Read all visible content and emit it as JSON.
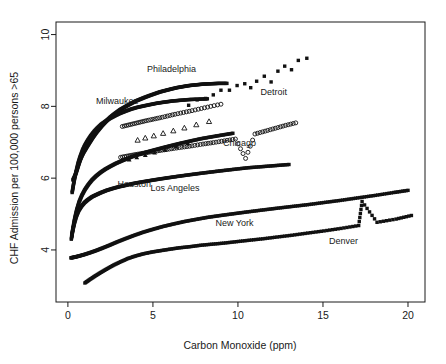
{
  "chart_data": {
    "type": "scatter",
    "title": "",
    "xlabel": "Carbon Monoxide (ppm)",
    "ylabel": "CHF Admission per 100,000 persons >65",
    "xlim": [
      -0.7,
      21.0
    ],
    "ylim": [
      2.55,
      10.35
    ],
    "xticks": [
      0,
      5,
      10,
      15,
      20
    ],
    "xtick_labels": [
      "0",
      "5",
      "10",
      "15",
      "20"
    ],
    "yticks": [
      4,
      6,
      8,
      10
    ],
    "ytick_labels": [
      "4",
      "6",
      "8",
      "10"
    ],
    "grid": false,
    "legend": "inline-annotations",
    "series": [
      {
        "name": "Philadelphia",
        "marker": "filled-square",
        "label_x": 6.1,
        "label_y": 8.95,
        "points": [
          [
            0.3,
            5.95
          ],
          [
            0.4,
            6.05
          ],
          [
            0.5,
            6.18
          ],
          [
            0.58,
            6.3
          ],
          [
            0.66,
            6.42
          ],
          [
            0.74,
            6.53
          ],
          [
            0.82,
            6.62
          ],
          [
            0.9,
            6.7
          ],
          [
            1.0,
            6.78
          ],
          [
            1.1,
            6.86
          ],
          [
            1.22,
            6.95
          ],
          [
            1.34,
            7.04
          ],
          [
            1.46,
            7.13
          ],
          [
            1.58,
            7.21
          ],
          [
            1.72,
            7.3
          ],
          [
            1.86,
            7.38
          ],
          [
            2.0,
            7.46
          ],
          [
            2.16,
            7.54
          ],
          [
            2.32,
            7.62
          ],
          [
            2.5,
            7.7
          ],
          [
            2.68,
            7.77
          ],
          [
            2.88,
            7.84
          ],
          [
            3.08,
            7.91
          ],
          [
            3.3,
            7.97
          ],
          [
            3.52,
            8.03
          ],
          [
            3.76,
            8.09
          ],
          [
            4.0,
            8.15
          ],
          [
            4.26,
            8.2
          ],
          [
            4.52,
            8.25
          ],
          [
            4.8,
            8.3
          ],
          [
            5.1,
            8.35
          ],
          [
            5.4,
            8.4
          ],
          [
            5.72,
            8.44
          ],
          [
            6.05,
            8.48
          ],
          [
            6.4,
            8.52
          ],
          [
            6.76,
            8.55
          ],
          [
            7.14,
            8.58
          ],
          [
            7.54,
            8.6
          ],
          [
            7.96,
            8.62
          ],
          [
            8.4,
            8.63
          ],
          [
            8.86,
            8.64
          ],
          [
            9.35,
            8.64
          ]
        ]
      },
      {
        "name": "Milwaukee",
        "marker": "filled-square",
        "label_x": 2.9,
        "label_y": 8.07,
        "points": [
          [
            0.25,
            5.6
          ],
          [
            0.32,
            5.8
          ],
          [
            0.4,
            6.0
          ],
          [
            0.5,
            6.22
          ],
          [
            0.6,
            6.42
          ],
          [
            0.72,
            6.6
          ],
          [
            0.86,
            6.78
          ],
          [
            1.0,
            6.92
          ],
          [
            1.16,
            7.05
          ],
          [
            1.34,
            7.18
          ],
          [
            1.54,
            7.3
          ],
          [
            1.74,
            7.4
          ],
          [
            1.96,
            7.5
          ],
          [
            2.2,
            7.58
          ],
          [
            2.46,
            7.66
          ],
          [
            2.74,
            7.73
          ],
          [
            3.04,
            7.8
          ],
          [
            3.36,
            7.86
          ],
          [
            3.7,
            7.92
          ],
          [
            4.06,
            7.97
          ],
          [
            4.44,
            8.01
          ],
          [
            4.84,
            8.05
          ],
          [
            5.26,
            8.09
          ],
          [
            5.7,
            8.12
          ],
          [
            6.16,
            8.15
          ],
          [
            6.64,
            8.17
          ],
          [
            7.14,
            8.19
          ],
          [
            7.66,
            8.2
          ],
          [
            8.2,
            8.21
          ]
        ]
      },
      {
        "name": "Detroit",
        "marker": "filled-square",
        "label_x": 12.1,
        "label_y": 8.33,
        "points": [
          [
            7.1,
            8.03
          ],
          [
            7.6,
            8.18
          ],
          [
            8.1,
            8.22
          ],
          [
            8.55,
            8.32
          ],
          [
            9.0,
            8.45
          ],
          [
            9.5,
            8.45
          ],
          [
            9.95,
            8.58
          ],
          [
            10.4,
            8.63
          ],
          [
            10.75,
            8.52
          ],
          [
            11.1,
            8.7
          ],
          [
            11.55,
            8.84
          ],
          [
            11.95,
            8.68
          ],
          [
            12.35,
            8.98
          ],
          [
            12.75,
            9.12
          ],
          [
            13.15,
            9.02
          ],
          [
            13.55,
            9.28
          ],
          [
            14.05,
            9.34
          ]
        ]
      },
      {
        "name": "Chicago",
        "marker": "open-circle",
        "label_x": 10.1,
        "label_y": 6.9,
        "points": [
          [
            3.1,
            6.58
          ],
          [
            3.55,
            6.62
          ],
          [
            4.0,
            6.66
          ],
          [
            4.5,
            6.7
          ],
          [
            5.0,
            6.74
          ],
          [
            5.55,
            6.78
          ],
          [
            6.1,
            6.82
          ],
          [
            6.7,
            6.86
          ],
          [
            7.3,
            6.9
          ],
          [
            7.95,
            6.95
          ],
          [
            8.55,
            6.99
          ],
          [
            9.2,
            7.04
          ],
          [
            9.85,
            7.09
          ],
          [
            10.45,
            6.55
          ],
          [
            11.0,
            7.23
          ],
          [
            11.6,
            7.31
          ],
          [
            12.2,
            7.39
          ],
          [
            12.8,
            7.47
          ],
          [
            13.4,
            7.54
          ]
        ]
      },
      {
        "name": "Houston",
        "marker": "filled-square",
        "label_x": 3.9,
        "label_y": 5.75,
        "points": [
          [
            0.22,
            4.38
          ],
          [
            0.3,
            4.62
          ],
          [
            0.4,
            4.88
          ],
          [
            0.52,
            5.12
          ],
          [
            0.66,
            5.34
          ],
          [
            0.82,
            5.52
          ],
          [
            1.0,
            5.68
          ],
          [
            1.2,
            5.82
          ],
          [
            1.42,
            5.95
          ],
          [
            1.66,
            6.06
          ],
          [
            1.92,
            6.16
          ],
          [
            2.2,
            6.25
          ],
          [
            2.5,
            6.33
          ],
          [
            2.82,
            6.41
          ],
          [
            3.16,
            6.48
          ],
          [
            3.52,
            6.55
          ],
          [
            3.9,
            6.62
          ],
          [
            4.3,
            6.68
          ],
          [
            4.74,
            6.74
          ],
          [
            5.2,
            6.8
          ],
          [
            5.68,
            6.86
          ],
          [
            6.18,
            6.92
          ],
          [
            6.7,
            6.98
          ],
          [
            7.26,
            7.04
          ],
          [
            7.84,
            7.1
          ],
          [
            8.44,
            7.15
          ],
          [
            9.06,
            7.2
          ],
          [
            9.7,
            7.25
          ]
        ]
      },
      {
        "name": "Los Angeles",
        "marker": "filled-square",
        "label_x": 6.3,
        "label_y": 5.64,
        "points": [
          [
            0.2,
            4.3
          ],
          [
            0.28,
            4.52
          ],
          [
            0.38,
            4.74
          ],
          [
            0.5,
            4.94
          ],
          [
            0.64,
            5.1
          ],
          [
            0.8,
            5.22
          ],
          [
            0.98,
            5.32
          ],
          [
            1.18,
            5.4
          ],
          [
            1.42,
            5.48
          ],
          [
            1.68,
            5.54
          ],
          [
            1.96,
            5.6
          ],
          [
            2.28,
            5.66
          ],
          [
            2.62,
            5.71
          ],
          [
            3.0,
            5.76
          ],
          [
            3.4,
            5.8
          ],
          [
            3.84,
            5.85
          ],
          [
            4.3,
            5.89
          ],
          [
            4.8,
            5.93
          ],
          [
            5.32,
            5.97
          ],
          [
            5.88,
            6.01
          ],
          [
            6.46,
            6.05
          ],
          [
            7.08,
            6.09
          ],
          [
            7.72,
            6.13
          ],
          [
            8.4,
            6.17
          ],
          [
            9.1,
            6.21
          ],
          [
            9.84,
            6.25
          ],
          [
            10.6,
            6.29
          ],
          [
            11.4,
            6.32
          ],
          [
            12.2,
            6.35
          ],
          [
            13.0,
            6.38
          ]
        ]
      },
      {
        "name": "New York",
        "marker": "filled-square",
        "label_x": 9.8,
        "label_y": 4.67,
        "points": [
          [
            0.18,
            3.78
          ],
          [
            0.4,
            3.8
          ],
          [
            0.65,
            3.83
          ],
          [
            0.95,
            3.87
          ],
          [
            1.28,
            3.92
          ],
          [
            1.64,
            3.98
          ],
          [
            2.02,
            4.05
          ],
          [
            2.44,
            4.13
          ],
          [
            2.88,
            4.22
          ],
          [
            3.36,
            4.31
          ],
          [
            3.86,
            4.4
          ],
          [
            4.4,
            4.49
          ],
          [
            4.96,
            4.57
          ],
          [
            5.56,
            4.65
          ],
          [
            6.18,
            4.72
          ],
          [
            6.84,
            4.79
          ],
          [
            7.52,
            4.85
          ],
          [
            8.24,
            4.91
          ],
          [
            8.98,
            4.96
          ],
          [
            9.76,
            5.01
          ],
          [
            10.56,
            5.06
          ],
          [
            11.4,
            5.11
          ],
          [
            12.26,
            5.16
          ],
          [
            13.16,
            5.21
          ],
          [
            14.08,
            5.26
          ],
          [
            15.04,
            5.32
          ],
          [
            16.02,
            5.38
          ],
          [
            17.04,
            5.45
          ],
          [
            18.08,
            5.52
          ],
          [
            19.16,
            5.6
          ],
          [
            20.0,
            5.66
          ]
        ]
      },
      {
        "name": "Denver",
        "marker": "filled-square",
        "label_x": 16.2,
        "label_y": 4.18,
        "points": [
          [
            1.0,
            3.08
          ],
          [
            1.3,
            3.18
          ],
          [
            1.62,
            3.28
          ],
          [
            1.96,
            3.38
          ],
          [
            2.32,
            3.48
          ],
          [
            2.7,
            3.58
          ],
          [
            3.1,
            3.67
          ],
          [
            3.52,
            3.76
          ],
          [
            3.96,
            3.83
          ],
          [
            4.42,
            3.89
          ],
          [
            4.92,
            3.94
          ],
          [
            5.44,
            3.98
          ],
          [
            5.98,
            4.02
          ],
          [
            6.56,
            4.06
          ],
          [
            7.16,
            4.09
          ],
          [
            7.8,
            4.13
          ],
          [
            8.46,
            4.16
          ],
          [
            9.16,
            4.19
          ],
          [
            9.9,
            4.23
          ],
          [
            10.66,
            4.27
          ],
          [
            11.46,
            4.31
          ],
          [
            12.3,
            4.36
          ],
          [
            13.18,
            4.41
          ],
          [
            14.1,
            4.47
          ],
          [
            15.06,
            4.53
          ],
          [
            16.06,
            4.6
          ],
          [
            17.1,
            4.68
          ],
          [
            17.3,
            5.35
          ],
          [
            18.18,
            4.77
          ],
          [
            19.3,
            4.86
          ],
          [
            20.2,
            4.96
          ]
        ]
      },
      {
        "name": "series-open-circles-upper",
        "marker": "open-circle",
        "label_x": null,
        "label_y": null,
        "points": [
          [
            3.2,
            7.44
          ],
          [
            3.55,
            7.48
          ],
          [
            3.9,
            7.52
          ],
          [
            4.25,
            7.56
          ],
          [
            4.6,
            7.6
          ],
          [
            5.0,
            7.64
          ],
          [
            5.4,
            7.68
          ],
          [
            5.85,
            7.73
          ],
          [
            6.3,
            7.78
          ],
          [
            6.8,
            7.83
          ],
          [
            7.3,
            7.88
          ],
          [
            7.85,
            7.94
          ],
          [
            8.4,
            8.0
          ],
          [
            9.0,
            8.06
          ]
        ]
      },
      {
        "name": "series-open-triangles",
        "marker": "open-triangle",
        "label_x": null,
        "label_y": null,
        "points": [
          [
            4.1,
            7.06
          ],
          [
            4.55,
            7.12
          ],
          [
            5.05,
            7.18
          ],
          [
            5.6,
            7.25
          ],
          [
            6.2,
            7.32
          ],
          [
            6.85,
            7.4
          ],
          [
            7.55,
            7.49
          ],
          [
            8.3,
            7.58
          ]
        ]
      },
      {
        "name": "series-filled-triangles",
        "marker": "filled-triangle",
        "label_x": null,
        "label_y": null,
        "points": [
          [
            3.6,
            6.52
          ],
          [
            4.05,
            6.58
          ],
          [
            4.55,
            6.64
          ],
          [
            5.1,
            6.71
          ],
          [
            5.7,
            6.79
          ],
          [
            6.35,
            6.88
          ],
          [
            7.05,
            6.97
          ]
        ]
      }
    ]
  },
  "axes": {
    "x_label": "Carbon Monoxide (ppm)",
    "y_label": "CHF Admission per 100,000 persons >65"
  }
}
